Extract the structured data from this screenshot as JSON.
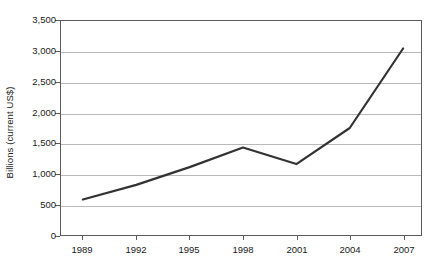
{
  "chart_data": {
    "type": "line",
    "title": "",
    "subtitle": "",
    "xlabel": "",
    "ylabel": "Billions (current US$)",
    "categories": [
      "1989",
      "1992",
      "1995",
      "1998",
      "2001",
      "2004",
      "2007"
    ],
    "x": [
      1989,
      1992,
      1995,
      1998,
      2001,
      2004,
      2007
    ],
    "values": [
      580,
      820,
      1110,
      1430,
      1160,
      1750,
      3050
    ],
    "series": [
      {
        "name": "",
        "values": [
          580,
          820,
          1110,
          1430,
          1160,
          1750,
          3050
        ]
      }
    ],
    "ylim": [
      0,
      3500
    ],
    "ytick_values": [
      0,
      500,
      1000,
      1500,
      2000,
      2500,
      3000,
      3500
    ],
    "ytick_labels": [
      "0",
      "500",
      "1,000",
      "1,500",
      "2,000",
      "2,500",
      "3,000",
      "3,500"
    ],
    "xtick_labels": [
      "1989",
      "1992",
      "1995",
      "1998",
      "2001",
      "2004",
      "2007"
    ],
    "grid": true,
    "grid_axis": "y",
    "legend": false,
    "legend_position": "none",
    "line_color": "#333333",
    "grid_color": "#b9b9b9",
    "axis_color": "#5b5b5b",
    "background_color": "#ffffff",
    "annotations": []
  }
}
